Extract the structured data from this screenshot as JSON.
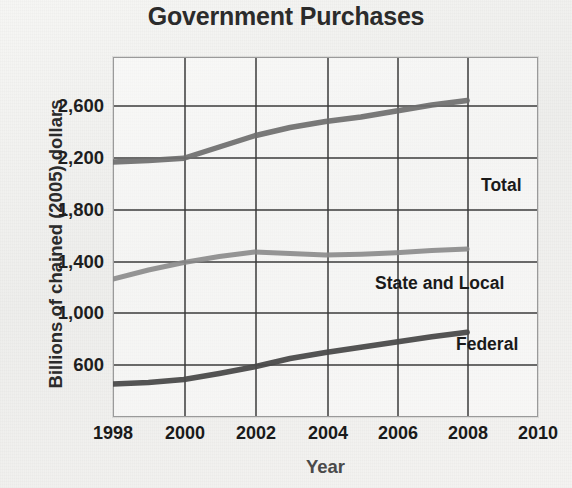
{
  "chart_data": {
    "type": "line",
    "title": "Government Purchases",
    "xlabel": "Year",
    "ylabel": "Billions of chained (2005) dollars",
    "xlim": [
      1998,
      2010
    ],
    "ylim": [
      400,
      2800
    ],
    "xticks": [
      "1998",
      "2000",
      "2002",
      "2004",
      "2006",
      "2008",
      "2010"
    ],
    "yticks": [
      "600",
      "1,000",
      "1,400",
      "1,800",
      "2,200",
      "2,600"
    ],
    "grid": true,
    "legend_position": "inline-right-labels",
    "x": [
      1998,
      1999,
      2000,
      2001,
      2002,
      2003,
      2004,
      2005,
      2006,
      2007,
      2008
    ],
    "series": [
      {
        "name": "Total",
        "label": "Total",
        "color": "#6e6e6e",
        "values": [
          2100,
          2110,
          2125,
          2200,
          2275,
          2330,
          2370,
          2400,
          2440,
          2480,
          2510
        ]
      },
      {
        "name": "State and Local",
        "label": "State and Local",
        "color": "#8a8a8a",
        "values": [
          1320,
          1380,
          1430,
          1470,
          1500,
          1490,
          1480,
          1485,
          1495,
          1510,
          1520
        ]
      },
      {
        "name": "Federal",
        "label": "Federal",
        "color": "#4a4a4a",
        "values": [
          620,
          630,
          650,
          690,
          735,
          790,
          830,
          865,
          900,
          935,
          965
        ]
      }
    ]
  },
  "annotations": {
    "total": "Total",
    "state_and_local": "State and Local",
    "federal": "Federal"
  }
}
